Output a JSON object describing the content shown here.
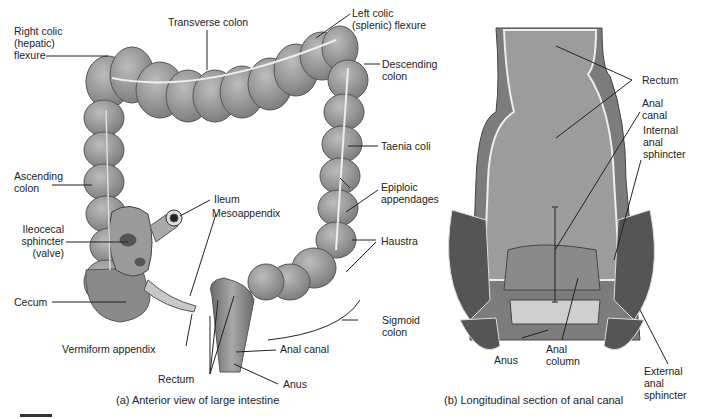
{
  "figure_a": {
    "caption": "(a) Anterior view of large intestine",
    "labels": {
      "right_colic": "Right colic\n(hepatic)\nflexure",
      "transverse_colon": "Transverse colon",
      "left_colic": "Left colic\n(splenic) flexure",
      "descending_colon": "Descending\ncolon",
      "taenia_coli": "Taenia coli",
      "ascending_colon": "Ascending\ncolon",
      "epiploic": "Epiploic\nappendages",
      "ileum": "Ileum",
      "mesoappendix": "Mesoappendix",
      "ileocecal": "Ileocecal\nsphincter\n(valve)",
      "haustra": "Haustra",
      "cecum": "Cecum",
      "sigmoid_colon": "Sigmoid\ncolon",
      "vermiform_appendix": "Vermiform appendix",
      "anal_canal": "Anal canal",
      "rectum": "Rectum",
      "anus": "Anus"
    }
  },
  "figure_b": {
    "caption": "(b) Longitudinal section of anal canal",
    "labels": {
      "rectum": "Rectum",
      "anal_canal": "Anal\ncanal",
      "internal_sphincter": "Internal\nanal\nsphincter",
      "anus": "Anus",
      "anal_column": "Anal\ncolumn",
      "external_sphincter": "External\nanal\nsphincter"
    }
  }
}
